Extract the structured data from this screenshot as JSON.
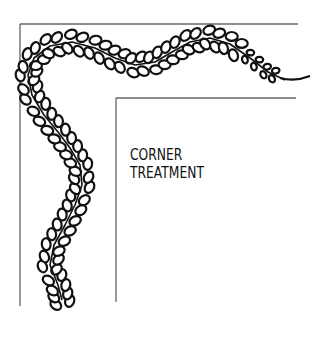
{
  "diagram": {
    "label_lines": [
      "CORNER",
      "TREATMENT"
    ],
    "outer_frame": {
      "x1": 20,
      "y1": 24,
      "x2": 298,
      "y2": 306
    },
    "inner_frame": {
      "x1": 116,
      "y1": 98,
      "x2": 298,
      "y2": 302
    },
    "stroke_color": "#111111",
    "frame_color": "#666666",
    "ornament": "feathered-vine"
  }
}
